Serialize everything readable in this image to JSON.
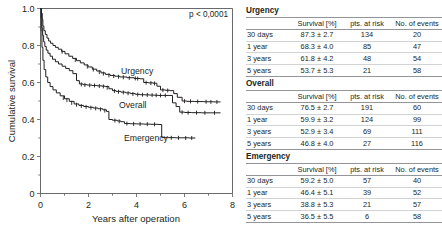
{
  "chart_data": {
    "type": "line",
    "subtype": "kaplan-meier-survival",
    "title": "",
    "xlabel": "Years after operation",
    "ylabel": "Cumulative survival",
    "xlim": [
      0,
      8
    ],
    "ylim": [
      0,
      1.0
    ],
    "xticks": [
      0,
      2,
      4,
      6,
      8
    ],
    "xtick_labels": [
      "0",
      "2",
      "4",
      "6",
      "8"
    ],
    "yticks": [
      0,
      0.2,
      0.4,
      0.6,
      0.8,
      1.0
    ],
    "ytick_labels": [
      "0",
      "0.2",
      "0.4",
      "0.6",
      "0.8",
      "1.0"
    ],
    "xminor_ticks": [
      1,
      3,
      5,
      7
    ],
    "yminor_ticks": [
      0.1,
      0.3,
      0.5,
      0.7,
      0.9
    ],
    "grid": false,
    "legend": "inline-annotations",
    "annotations": [
      {
        "text": "p < 0,0001",
        "x": 7.1,
        "y": 0.985
      },
      {
        "text": "Urgency",
        "x": 3.35,
        "y": 0.675
      },
      {
        "text": "Overall",
        "x": 3.25,
        "y": 0.495
      },
      {
        "text": "Emergency",
        "x": 3.55,
        "y": 0.318
      }
    ],
    "series": [
      {
        "name": "Urgency",
        "points": [
          [
            0.0,
            1.0
          ],
          [
            0.04,
            0.975
          ],
          [
            0.07,
            0.94
          ],
          [
            0.1,
            0.905
          ],
          [
            0.14,
            0.88
          ],
          [
            0.2,
            0.86
          ],
          [
            0.27,
            0.84
          ],
          [
            0.34,
            0.824
          ],
          [
            0.42,
            0.812
          ],
          [
            0.52,
            0.8
          ],
          [
            0.62,
            0.79
          ],
          [
            0.74,
            0.78
          ],
          [
            0.88,
            0.768
          ],
          [
            1.02,
            0.755
          ],
          [
            1.18,
            0.742
          ],
          [
            1.34,
            0.73
          ],
          [
            1.5,
            0.718
          ],
          [
            1.66,
            0.706
          ],
          [
            1.82,
            0.695
          ],
          [
            1.98,
            0.684
          ],
          [
            2.16,
            0.672
          ],
          [
            2.34,
            0.662
          ],
          [
            2.52,
            0.652
          ],
          [
            2.7,
            0.644
          ],
          [
            2.9,
            0.638
          ],
          [
            3.1,
            0.634
          ],
          [
            3.3,
            0.63
          ],
          [
            3.6,
            0.626
          ],
          [
            3.9,
            0.622
          ],
          [
            4.15,
            0.62
          ],
          [
            4.3,
            0.6
          ],
          [
            4.5,
            0.598
          ],
          [
            4.7,
            0.596
          ],
          [
            4.85,
            0.58
          ],
          [
            5.0,
            0.56
          ],
          [
            5.2,
            0.558
          ],
          [
            5.4,
            0.556
          ],
          [
            5.55,
            0.54
          ],
          [
            5.7,
            0.52
          ],
          [
            5.9,
            0.5
          ],
          [
            6.1,
            0.498
          ],
          [
            6.4,
            0.497
          ],
          [
            6.8,
            0.496
          ],
          [
            7.2,
            0.495
          ],
          [
            7.5,
            0.495
          ]
        ],
        "censored": [
          [
            0.05,
            0.96
          ],
          [
            0.9,
            0.766
          ],
          [
            1.45,
            0.722
          ],
          [
            1.95,
            0.686
          ],
          [
            2.2,
            0.67
          ],
          [
            2.45,
            0.656
          ],
          [
            2.62,
            0.648
          ],
          [
            2.85,
            0.639
          ],
          [
            3.05,
            0.635
          ],
          [
            3.25,
            0.631
          ],
          [
            3.45,
            0.628
          ],
          [
            3.7,
            0.625
          ],
          [
            3.95,
            0.622
          ],
          [
            4.05,
            0.621
          ],
          [
            4.4,
            0.599
          ],
          [
            4.6,
            0.597
          ],
          [
            4.75,
            0.595
          ],
          [
            5.1,
            0.559
          ],
          [
            5.3,
            0.557
          ],
          [
            6.0,
            0.499
          ],
          [
            6.25,
            0.498
          ],
          [
            6.55,
            0.497
          ],
          [
            6.9,
            0.496
          ],
          [
            7.1,
            0.495
          ],
          [
            7.35,
            0.495
          ]
        ]
      },
      {
        "name": "Overall",
        "points": [
          [
            0.0,
            1.0
          ],
          [
            0.03,
            0.95
          ],
          [
            0.06,
            0.895
          ],
          [
            0.09,
            0.855
          ],
          [
            0.13,
            0.82
          ],
          [
            0.18,
            0.795
          ],
          [
            0.24,
            0.775
          ],
          [
            0.31,
            0.758
          ],
          [
            0.4,
            0.742
          ],
          [
            0.5,
            0.726
          ],
          [
            0.62,
            0.712
          ],
          [
            0.75,
            0.7
          ],
          [
            0.9,
            0.688
          ],
          [
            1.05,
            0.676
          ],
          [
            1.2,
            0.664
          ],
          [
            1.35,
            0.648
          ],
          [
            1.5,
            0.61
          ],
          [
            1.62,
            0.592
          ],
          [
            1.78,
            0.588
          ],
          [
            1.95,
            0.586
          ],
          [
            2.15,
            0.584
          ],
          [
            2.35,
            0.582
          ],
          [
            2.55,
            0.58
          ],
          [
            2.7,
            0.578
          ],
          [
            2.85,
            0.566
          ],
          [
            3.0,
            0.556
          ],
          [
            3.15,
            0.552
          ],
          [
            3.35,
            0.548
          ],
          [
            3.55,
            0.544
          ],
          [
            3.75,
            0.54
          ],
          [
            3.95,
            0.536
          ],
          [
            4.15,
            0.534
          ],
          [
            4.35,
            0.533
          ],
          [
            4.55,
            0.532
          ],
          [
            4.75,
            0.531
          ],
          [
            4.9,
            0.53
          ],
          [
            5.1,
            0.53
          ],
          [
            5.35,
            0.53
          ],
          [
            5.5,
            0.49
          ],
          [
            5.65,
            0.47
          ],
          [
            5.8,
            0.44
          ],
          [
            6.0,
            0.438
          ],
          [
            6.3,
            0.437
          ],
          [
            6.7,
            0.436
          ],
          [
            7.1,
            0.436
          ],
          [
            7.5,
            0.436
          ]
        ],
        "censored": [
          [
            1.7,
            0.59
          ],
          [
            1.85,
            0.587
          ],
          [
            2.05,
            0.585
          ],
          [
            2.25,
            0.584
          ],
          [
            2.45,
            0.581
          ],
          [
            2.62,
            0.579
          ],
          [
            2.78,
            0.572
          ],
          [
            3.08,
            0.554
          ],
          [
            3.25,
            0.55
          ],
          [
            3.45,
            0.546
          ],
          [
            3.65,
            0.542
          ],
          [
            3.85,
            0.538
          ],
          [
            4.05,
            0.535
          ],
          [
            4.25,
            0.534
          ],
          [
            4.45,
            0.533
          ],
          [
            4.65,
            0.532
          ],
          [
            4.82,
            0.531
          ],
          [
            5.0,
            0.53
          ],
          [
            5.2,
            0.53
          ],
          [
            5.9,
            0.439
          ],
          [
            6.15,
            0.437
          ],
          [
            6.5,
            0.437
          ],
          [
            6.85,
            0.436
          ],
          [
            7.25,
            0.436
          ]
        ]
      },
      {
        "name": "Emergency",
        "points": [
          [
            0.0,
            1.0
          ],
          [
            0.03,
            0.88
          ],
          [
            0.06,
            0.79
          ],
          [
            0.1,
            0.72
          ],
          [
            0.15,
            0.67
          ],
          [
            0.22,
            0.63
          ],
          [
            0.3,
            0.6
          ],
          [
            0.4,
            0.578
          ],
          [
            0.52,
            0.56
          ],
          [
            0.66,
            0.544
          ],
          [
            0.82,
            0.528
          ],
          [
            1.0,
            0.512
          ],
          [
            1.2,
            0.498
          ],
          [
            1.4,
            0.484
          ],
          [
            1.6,
            0.476
          ],
          [
            1.8,
            0.47
          ],
          [
            2.0,
            0.466
          ],
          [
            2.2,
            0.462
          ],
          [
            2.4,
            0.458
          ],
          [
            2.6,
            0.452
          ],
          [
            2.75,
            0.444
          ],
          [
            2.85,
            0.4
          ],
          [
            3.0,
            0.396
          ],
          [
            3.2,
            0.392
          ],
          [
            3.35,
            0.388
          ],
          [
            3.5,
            0.378
          ],
          [
            3.75,
            0.377
          ],
          [
            4.0,
            0.376
          ],
          [
            4.3,
            0.375
          ],
          [
            4.6,
            0.374
          ],
          [
            4.9,
            0.373
          ],
          [
            5.05,
            0.302
          ],
          [
            5.3,
            0.302
          ],
          [
            5.6,
            0.301
          ],
          [
            5.9,
            0.301
          ],
          [
            6.2,
            0.3
          ],
          [
            6.45,
            0.3
          ]
        ],
        "censored": [
          [
            0.95,
            0.516
          ],
          [
            1.1,
            0.505
          ],
          [
            1.3,
            0.49
          ],
          [
            1.5,
            0.48
          ],
          [
            1.7,
            0.473
          ],
          [
            1.9,
            0.468
          ],
          [
            2.1,
            0.464
          ],
          [
            2.3,
            0.46
          ],
          [
            2.5,
            0.455
          ],
          [
            2.68,
            0.448
          ],
          [
            3.1,
            0.394
          ],
          [
            3.28,
            0.39
          ],
          [
            3.6,
            0.378
          ],
          [
            3.88,
            0.376
          ],
          [
            4.15,
            0.376
          ],
          [
            4.45,
            0.375
          ],
          [
            4.75,
            0.374
          ],
          [
            5.45,
            0.301
          ],
          [
            5.75,
            0.301
          ],
          [
            6.05,
            0.3
          ],
          [
            6.3,
            0.3
          ]
        ]
      }
    ]
  },
  "chart": {
    "ylabel": "Cumulative survival",
    "xlabel": "Years after operation",
    "pvalue": "p < 0,0001",
    "xtick_labels": [
      "0",
      "2",
      "4",
      "6",
      "8"
    ],
    "ytick_labels": [
      "1.0",
      "0.8",
      "0.6",
      "0.4",
      "0.2",
      "0"
    ],
    "label_urgency": "Urgency",
    "label_overall": "Overall",
    "label_emergency": "Emergency"
  },
  "tables": [
    {
      "title": "Urgency",
      "columns": [
        "",
        "Survival [%]",
        "pts. at risk",
        "No. of events"
      ],
      "rows": [
        {
          "label": "30 days",
          "survival": "87.3 ± 2.7",
          "at_risk": "134",
          "events": "20"
        },
        {
          "label": "1 year",
          "survival": "68.3 ± 4.0",
          "at_risk": "85",
          "events": "47"
        },
        {
          "label": "3 years",
          "survival": "61.8 ± 4.2",
          "at_risk": "48",
          "events": "54"
        },
        {
          "label": "5 years",
          "survival": "53.7 ± 5.3",
          "at_risk": "21",
          "events": "58"
        }
      ]
    },
    {
      "title": "Overall",
      "columns": [
        "",
        "Survival [%]",
        "pts. at risk",
        "No. of events"
      ],
      "rows": [
        {
          "label": "30 days",
          "survival": "76.5 ± 2.7",
          "at_risk": "191",
          "events": "60"
        },
        {
          "label": "1 year",
          "survival": "59.9 ± 3.2",
          "at_risk": "124",
          "events": "99"
        },
        {
          "label": "3 years",
          "survival": "52.9 ± 3.4",
          "at_risk": "69",
          "events": "111"
        },
        {
          "label": "5 years",
          "survival": "46.8 ± 4.0",
          "at_risk": "27",
          "events": "116"
        }
      ]
    },
    {
      "title": "Emergency",
      "columns": [
        "",
        "Survival [%]",
        "pts. at risk",
        "No. of events"
      ],
      "rows": [
        {
          "label": "30 days",
          "survival": "59.2 ± 5.0",
          "at_risk": "57",
          "events": "40"
        },
        {
          "label": "1 year",
          "survival": "46.4 ± 5.1",
          "at_risk": "39",
          "events": "52"
        },
        {
          "label": "3 years",
          "survival": "38.8 ± 5.3",
          "at_risk": "21",
          "events": "57"
        },
        {
          "label": "5 years",
          "survival": "36.5 ± 5.5",
          "at_risk": "6",
          "events": "58"
        }
      ]
    }
  ],
  "colors": {
    "ink": "#231f20",
    "axis": "#58595b",
    "rule_strong": "#939598",
    "rule_light": "#d1d3d4",
    "background": "#ffffff"
  }
}
